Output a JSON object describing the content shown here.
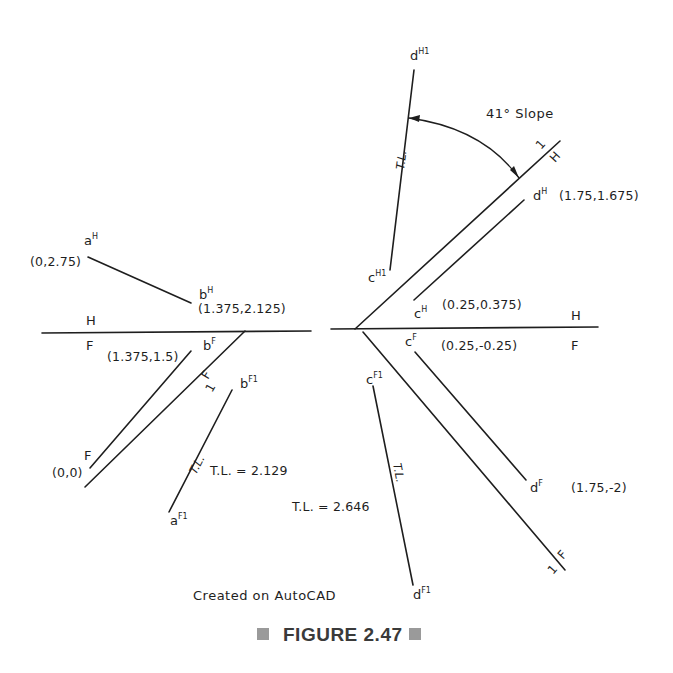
{
  "figure": {
    "caption": "FIGURE 2.47",
    "note": "Created on AutoCAD",
    "slope_label": "41° Slope"
  },
  "left_view": {
    "fold_line_HF": {
      "upper": "H",
      "lower": "F"
    },
    "fold_line_F1": {
      "upper": "F",
      "lower": "1"
    },
    "points": {
      "aH": {
        "letter": "a",
        "sup": "H",
        "coord": "(0,2.75)"
      },
      "bH": {
        "letter": "b",
        "sup": "H",
        "coord": "(1.375,2.125)"
      },
      "bF": {
        "letter": "b",
        "sup": "F",
        "coord": "(1.375,1.5)"
      },
      "aF": {
        "letter": "F",
        "coord": "(0,0)"
      },
      "bF1": {
        "letter": "b",
        "sup": "F1"
      },
      "aF1": {
        "letter": "a",
        "sup": "F1"
      }
    },
    "true_length_tag": "T.L.",
    "true_length": "T.L. = 2.129"
  },
  "right_view": {
    "fold_line_HF": {
      "upper": "H",
      "lower": "F"
    },
    "fold_line_H1": {
      "upper": "1",
      "lower": "H"
    },
    "fold_line_F1": {
      "upper": "F",
      "lower": "1"
    },
    "points": {
      "dH1": {
        "letter": "d",
        "sup": "H1"
      },
      "cH1": {
        "letter": "c",
        "sup": "H1"
      },
      "dH": {
        "letter": "d",
        "sup": "H",
        "coord": "(1.75,1.675)"
      },
      "cH": {
        "letter": "c",
        "sup": "H",
        "coord": "(0.25,0.375)"
      },
      "cF": {
        "letter": "c",
        "sup": "F",
        "coord": "(0.25,-0.25)"
      },
      "dF": {
        "letter": "d",
        "sup": "F",
        "coord": "(1.75,-2)"
      },
      "cF1": {
        "letter": "c",
        "sup": "F1"
      },
      "dF1": {
        "letter": "d",
        "sup": "F1"
      }
    },
    "true_length_tag_upper": "T.L.",
    "true_length_tag_lower": "T.L.",
    "true_length": "T.L. = 2.646"
  },
  "colors": {
    "ink": "#1e1e1e",
    "caption": "#3a3a3a",
    "caption_box": "#9a9a9a",
    "background": "#ffffff"
  }
}
